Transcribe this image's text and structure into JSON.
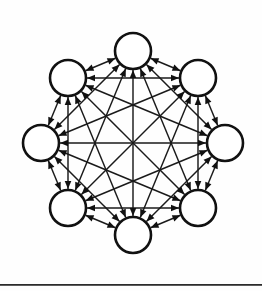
{
  "figure": {
    "type": "graph-diagram",
    "caption": "",
    "background_color": "#fefefe",
    "stroke_color": "#111111",
    "node_fill_color": "#ffffff"
  },
  "canvas": {
    "width": 262,
    "height": 291
  },
  "graph": {
    "node_count": 8,
    "edge_count": 28,
    "edge_style": "bidirectional-double-arrow",
    "layout": "circular",
    "center_x": 133,
    "center_y": 143,
    "ring_radius": 92,
    "node_radius": 18,
    "start_angle_deg": -90,
    "nodes": [
      {
        "id": "n1",
        "label": "",
        "angle_deg": -90,
        "cx": 133,
        "cy": 51
      },
      {
        "id": "n2",
        "label": "",
        "angle_deg": -45,
        "cx": 198,
        "cy": 78
      },
      {
        "id": "n3",
        "label": "",
        "angle_deg": 0,
        "cx": 225,
        "cy": 143
      },
      {
        "id": "n4",
        "label": "",
        "angle_deg": 45,
        "cx": 198,
        "cy": 208
      },
      {
        "id": "n5",
        "label": "",
        "angle_deg": 90,
        "cx": 133,
        "cy": 235
      },
      {
        "id": "n6",
        "label": "",
        "angle_deg": 135,
        "cx": 68,
        "cy": 208
      },
      {
        "id": "n7",
        "label": "",
        "angle_deg": 180,
        "cx": 41,
        "cy": 143
      },
      {
        "id": "n8",
        "label": "",
        "angle_deg": 225,
        "cx": 68,
        "cy": 78
      }
    ],
    "edges": [
      [
        "n1",
        "n2"
      ],
      [
        "n1",
        "n3"
      ],
      [
        "n1",
        "n4"
      ],
      [
        "n1",
        "n5"
      ],
      [
        "n1",
        "n6"
      ],
      [
        "n1",
        "n7"
      ],
      [
        "n1",
        "n8"
      ],
      [
        "n2",
        "n3"
      ],
      [
        "n2",
        "n4"
      ],
      [
        "n2",
        "n5"
      ],
      [
        "n2",
        "n6"
      ],
      [
        "n2",
        "n7"
      ],
      [
        "n2",
        "n8"
      ],
      [
        "n3",
        "n4"
      ],
      [
        "n3",
        "n5"
      ],
      [
        "n3",
        "n6"
      ],
      [
        "n3",
        "n7"
      ],
      [
        "n3",
        "n8"
      ],
      [
        "n4",
        "n5"
      ],
      [
        "n4",
        "n6"
      ],
      [
        "n4",
        "n7"
      ],
      [
        "n4",
        "n8"
      ],
      [
        "n5",
        "n6"
      ],
      [
        "n5",
        "n7"
      ],
      [
        "n5",
        "n8"
      ],
      [
        "n6",
        "n7"
      ],
      [
        "n6",
        "n8"
      ],
      [
        "n7",
        "n8"
      ]
    ]
  },
  "rule": {
    "y": 284,
    "color": "#2b2b2b"
  }
}
